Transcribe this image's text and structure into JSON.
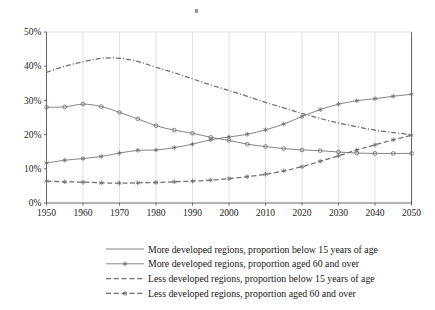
{
  "chart_data": {
    "type": "line",
    "title": "",
    "subtitle": "",
    "xlabel": "",
    "ylabel": "",
    "xlim": [
      1950,
      2050
    ],
    "ylim": [
      0,
      50
    ],
    "y_unit": "%",
    "grid": "vertical-decade-gridlines",
    "legend_position": "bottom",
    "x_tick_labels": [
      "1950",
      "1960",
      "1970",
      "1980",
      "1990",
      "2000",
      "2010",
      "2020",
      "2030",
      "2040",
      "2050"
    ],
    "y_tick_labels": [
      "0%",
      "10%",
      "20%",
      "30%",
      "40%",
      "50%"
    ],
    "x": [
      1950,
      1955,
      1960,
      1965,
      1970,
      1975,
      1980,
      1985,
      1990,
      1995,
      2000,
      2005,
      2010,
      2015,
      2020,
      2025,
      2030,
      2035,
      2040,
      2045,
      2050
    ],
    "series": [
      {
        "name": "More developed regions, proportion below 15 years of age",
        "style": "solid",
        "marker": "circle",
        "color": "#6e6e6e",
        "values": [
          28.0,
          28.1,
          28.9,
          28.2,
          26.5,
          24.6,
          22.6,
          21.3,
          20.4,
          19.2,
          18.3,
          17.2,
          16.5,
          15.9,
          15.5,
          15.3,
          14.9,
          14.6,
          14.5,
          14.5,
          14.5
        ]
      },
      {
        "name": "More developed regions, proportion aged 60 and over",
        "style": "solid",
        "marker": "star",
        "color": "#6e6e6e",
        "values": [
          11.7,
          12.5,
          13.0,
          13.6,
          14.6,
          15.4,
          15.5,
          16.2,
          17.2,
          18.5,
          19.3,
          20.1,
          21.4,
          23.1,
          25.3,
          27.3,
          28.9,
          29.9,
          30.5,
          31.2,
          31.8
        ]
      },
      {
        "name": "Less developed regions, proportion below 15 years of age",
        "style": "dash-dot",
        "marker": "none",
        "color": "#555555",
        "values": [
          38.2,
          40.0,
          41.3,
          42.3,
          42.3,
          41.4,
          39.7,
          38.1,
          36.3,
          34.5,
          32.9,
          31.2,
          29.4,
          27.8,
          26.2,
          24.7,
          23.4,
          22.3,
          21.3,
          20.6,
          20.0
        ]
      },
      {
        "name": "Less developed regions, proportion aged 60 and over",
        "style": "dashed",
        "marker": "star",
        "color": "#6e6e6e",
        "values": [
          6.4,
          6.2,
          6.1,
          5.9,
          5.8,
          5.9,
          6.0,
          6.2,
          6.4,
          6.7,
          7.1,
          7.7,
          8.4,
          9.4,
          10.6,
          12.2,
          13.8,
          15.5,
          17.0,
          18.5,
          19.8
        ]
      }
    ]
  },
  "legend": {
    "items": [
      {
        "label": "More developed regions, proportion below 15 years of age",
        "style": "solid",
        "marker": "none"
      },
      {
        "label": "More developed regions, proportion aged 60 and over",
        "style": "solid",
        "marker": "star"
      },
      {
        "label": "Less developed regions, proportion below 15 years of age",
        "style": "dashed",
        "marker": "none"
      },
      {
        "label": "Less developed regions, proportion aged 60 and over",
        "style": "dashed",
        "marker": "star"
      }
    ]
  },
  "colors": {
    "line": "#6e6e6e",
    "axis": "#555555",
    "grid": "#cfcfcf",
    "text": "#1a1a1a",
    "background": "#ffffff"
  }
}
